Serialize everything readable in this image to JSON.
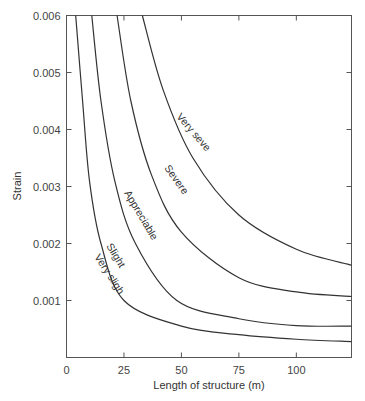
{
  "chart_data": {
    "type": "line",
    "title": "",
    "xlabel": "Length of structure (m)",
    "ylabel": "Strain",
    "xlim": [
      0,
      124
    ],
    "ylim": [
      0,
      0.006
    ],
    "grid": false,
    "legend": "none (curves labeled inline)",
    "x_ticks": [
      0,
      25,
      50,
      75,
      100
    ],
    "x_tick_labels": [
      "0",
      "25",
      "50",
      "75",
      "100"
    ],
    "y_ticks": [
      0.001,
      0.002,
      0.003,
      0.004,
      0.005,
      0.006
    ],
    "y_tick_labels": [
      "0.001",
      "0.002",
      "0.003",
      "0.004",
      "0.005",
      "0.006"
    ],
    "series": [
      {
        "name": "Very slight / Slight boundary",
        "labels": [
          "Slight",
          "Very slight"
        ],
        "points": [
          [
            4,
            0.006
          ],
          [
            7,
            0.0045
          ],
          [
            10,
            0.0031
          ],
          [
            15,
            0.002
          ],
          [
            25,
            0.001
          ],
          [
            50,
            0.00055
          ],
          [
            75,
            0.0004
          ],
          [
            100,
            0.00032
          ],
          [
            124,
            0.00028
          ]
        ]
      },
      {
        "name": "Appreciable",
        "labels": [
          "Appreciable"
        ],
        "points": [
          [
            11,
            0.006
          ],
          [
            15,
            0.0045
          ],
          [
            21,
            0.0031
          ],
          [
            30,
            0.002
          ],
          [
            48,
            0.001
          ],
          [
            75,
            0.00068
          ],
          [
            100,
            0.00056
          ],
          [
            124,
            0.00055
          ]
        ]
      },
      {
        "name": "Severe",
        "labels": [
          "Severe"
        ],
        "points": [
          [
            22,
            0.006
          ],
          [
            28,
            0.0045
          ],
          [
            37,
            0.0032
          ],
          [
            50,
            0.0022
          ],
          [
            75,
            0.0014
          ],
          [
            100,
            0.00115
          ],
          [
            124,
            0.00107
          ]
        ]
      },
      {
        "name": "Very severe",
        "labels": [
          "Very severe"
        ],
        "points": [
          [
            33,
            0.006
          ],
          [
            42,
            0.0047
          ],
          [
            55,
            0.0035
          ],
          [
            75,
            0.0025
          ],
          [
            100,
            0.0019
          ],
          [
            124,
            0.00162
          ]
        ]
      }
    ],
    "annotations": [
      "Very severe",
      "Severe",
      "Appreciable",
      "Slight",
      "Very slight"
    ]
  },
  "axes": {
    "xlabel": "Length of structure (m)",
    "ylabel": "Strain",
    "x_ticks": [
      "0",
      "25",
      "50",
      "75",
      "100"
    ],
    "y_ticks": [
      "0.001",
      "0.002",
      "0.003",
      "0.004",
      "0.005",
      "0.006"
    ]
  },
  "labels": {
    "very_severe": "Very severe",
    "severe": "Severe",
    "appreciable": "Appreciable",
    "slight": "Slight",
    "very_slight": "Very slight"
  },
  "style": {
    "line_color": "#333333",
    "frame_color": "#555555"
  }
}
